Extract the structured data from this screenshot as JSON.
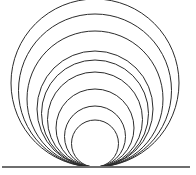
{
  "figure": {
    "background_color": "#ffffff",
    "canvas": {
      "width": 196,
      "height": 175
    }
  },
  "chart_data": {
    "type": "diagram",
    "subtype": "tangent-circle-pencil",
    "xlabel": "",
    "ylabel": "",
    "xlim": [
      0,
      196
    ],
    "ylim": [
      0,
      175
    ],
    "grid": false,
    "legend": "none",
    "tangent_point": {
      "x": 95,
      "y": 167
    },
    "stroke_color": "#2b2b2b",
    "stroke_width": 1,
    "circles": [
      {
        "index": 1,
        "cx": 95,
        "cy": 143.5,
        "r": 23.5,
        "top_y": 120,
        "left_x": 71.5,
        "right_x": 118.5,
        "diameter": 47
      },
      {
        "index": 2,
        "cx": 95,
        "cy": 136.5,
        "r": 30.5,
        "top_y": 106,
        "left_x": 64.5,
        "right_x": 125.5,
        "diameter": 61
      },
      {
        "index": 3,
        "cx": 95,
        "cy": 128.0,
        "r": 39.0,
        "top_y": 89,
        "left_x": 56.0,
        "right_x": 134.0,
        "diameter": 78
      },
      {
        "index": 4,
        "cx": 95,
        "cy": 119.5,
        "r": 47.5,
        "top_y": 72,
        "left_x": 47.5,
        "right_x": 142.5,
        "diameter": 95
      },
      {
        "index": 5,
        "cx": 95,
        "cy": 113.5,
        "r": 53.5,
        "top_y": 60,
        "left_x": 41.5,
        "right_x": 148.5,
        "diameter": 107
      },
      {
        "index": 6,
        "cx": 95,
        "cy": 109.0,
        "r": 58.0,
        "top_y": 51,
        "left_x": 37.0,
        "right_x": 153.0,
        "diameter": 116
      },
      {
        "index": 7,
        "cx": 95,
        "cy": 99.0,
        "r": 68.0,
        "top_y": 31,
        "left_x": 27.0,
        "right_x": 163.0,
        "diameter": 136
      },
      {
        "index": 8,
        "cx": 95,
        "cy": 90.5,
        "r": 76.5,
        "top_y": 14,
        "left_x": 18.5,
        "right_x": 171.5,
        "diameter": 153
      },
      {
        "index": 9,
        "cx": 95,
        "cy": 83.0,
        "r": 84.0,
        "top_y": -1,
        "left_x": 11.0,
        "right_x": 179.0,
        "diameter": 168
      }
    ],
    "baseline": {
      "label": "tangent-line",
      "x1": 2,
      "y1": 167,
      "x2": 190,
      "y2": 167,
      "color": "#6e6e6e",
      "width": 1.6
    },
    "counts": {
      "circles": 9,
      "lines": 1
    }
  }
}
